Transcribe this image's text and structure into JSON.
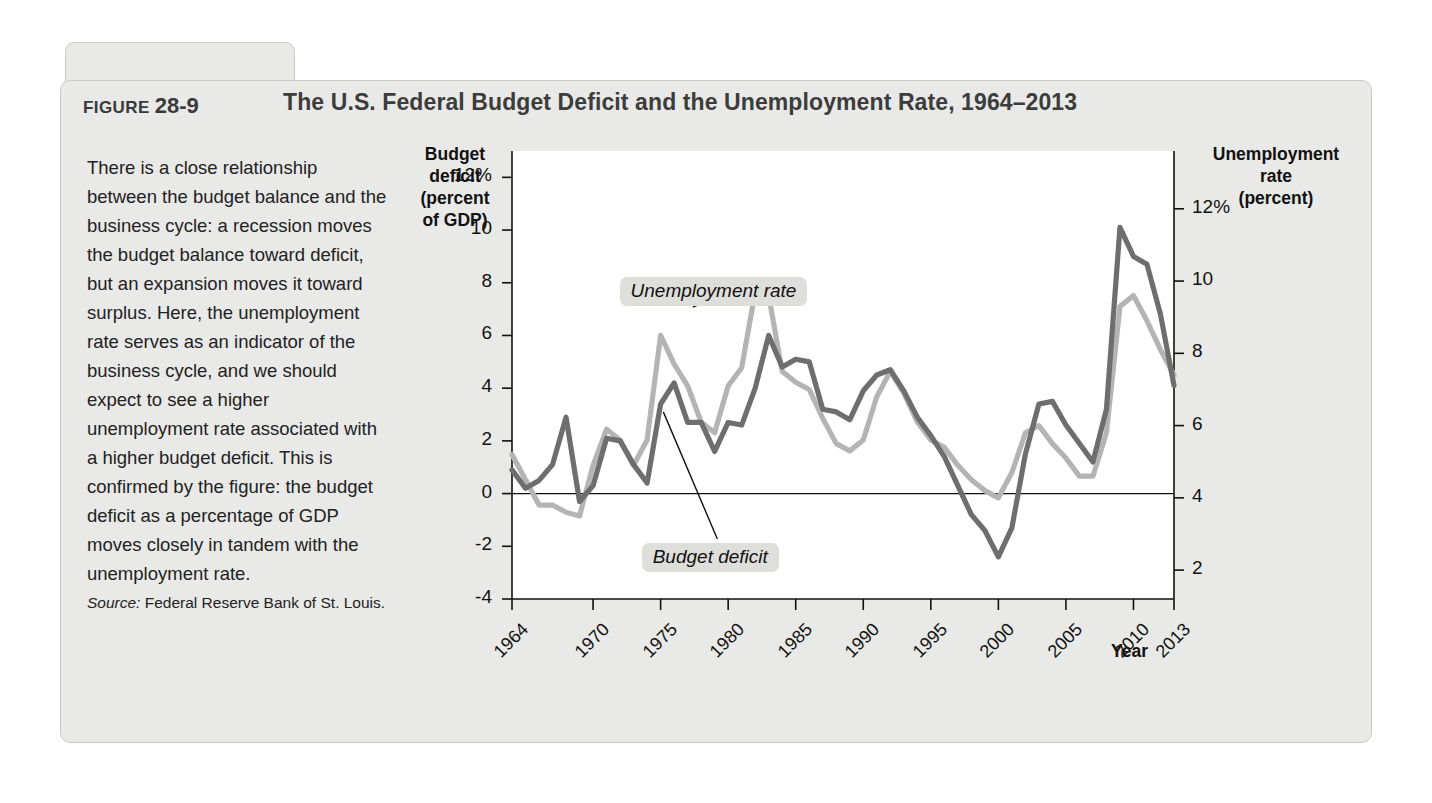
{
  "figure": {
    "label_word": "FIGURE",
    "number": "28-9",
    "title": "The U.S. Federal Budget Deficit and the Unemployment Rate, 1964–2013"
  },
  "caption": {
    "body": "There is a close relationship between the budget balance and the business cycle: a recession moves the budget balance toward deficit, but an expansion moves it toward surplus. Here, the unemployment rate serves as an indicator of the business cycle, and we should expect to see a higher unemployment rate associated with a higher budget deficit. This is confirmed by the figure: the budget deficit as a percentage of GDP moves closely in tandem with the unemployment rate.",
    "source_label": "Source:",
    "source_text": " Federal Reserve Bank of St. Louis."
  },
  "chart_data": {
    "type": "line",
    "title": "The U.S. Federal Budget Deficit and the Unemployment Rate, 1964–2013",
    "xlabel": "Year",
    "y_left_label": "Budget deficit (percent of GDP)",
    "y_left_label_lines": [
      "Budget",
      "deficit",
      "(percent",
      "of GDP)"
    ],
    "y_right_label": "Unemployment rate (percent)",
    "y_right_label_lines": [
      "Unemployment",
      "rate",
      "(percent)"
    ],
    "grid": false,
    "legend_position": "inline-annotations",
    "x": [
      1964,
      1965,
      1966,
      1967,
      1968,
      1969,
      1970,
      1971,
      1972,
      1973,
      1974,
      1975,
      1976,
      1977,
      1978,
      1979,
      1980,
      1981,
      1982,
      1983,
      1984,
      1985,
      1986,
      1987,
      1988,
      1989,
      1990,
      1991,
      1992,
      1993,
      1994,
      1995,
      1996,
      1997,
      1998,
      1999,
      2000,
      2001,
      2002,
      2003,
      2004,
      2005,
      2006,
      2007,
      2008,
      2009,
      2010,
      2011,
      2012,
      2013
    ],
    "xlim": [
      1964,
      2013
    ],
    "x_ticks": [
      "1964",
      "1970",
      "1975",
      "1980",
      "1985",
      "1990",
      "1995",
      "2000",
      "2005",
      "2010",
      "2013"
    ],
    "x_tick_values": [
      1964,
      1970,
      1975,
      1980,
      1985,
      1990,
      1995,
      2000,
      2005,
      2010,
      2013
    ],
    "y_left_ticks": [
      "12%",
      "10",
      "8",
      "6",
      "4",
      "2",
      "0",
      "-2",
      "-4"
    ],
    "y_left_tick_values": [
      12,
      10,
      8,
      6,
      4,
      2,
      0,
      -2,
      -4
    ],
    "ylim_left": [
      -4,
      13
    ],
    "y_right_ticks": [
      "12%",
      "10",
      "8",
      "6",
      "4",
      "2"
    ],
    "y_right_tick_values": [
      12,
      10,
      8,
      6,
      4,
      2
    ],
    "ylim_right": [
      1.2,
      13.6
    ],
    "series": [
      {
        "name": "Budget deficit",
        "axis": "left",
        "color": "#6e6e6e",
        "annotation": "Budget deficit",
        "values": [
          0.9,
          0.2,
          0.5,
          1.1,
          2.9,
          -0.3,
          0.3,
          2.1,
          2.0,
          1.1,
          0.4,
          3.4,
          4.2,
          2.7,
          2.7,
          1.6,
          2.7,
          2.6,
          4.0,
          6.0,
          4.8,
          5.1,
          5.0,
          3.2,
          3.1,
          2.8,
          3.9,
          4.5,
          4.7,
          3.9,
          2.9,
          2.2,
          1.4,
          0.3,
          -0.8,
          -1.4,
          -2.4,
          -1.3,
          1.5,
          3.4,
          3.5,
          2.6,
          1.9,
          1.2,
          3.2,
          10.1,
          9.0,
          8.7,
          6.8,
          4.1
        ]
      },
      {
        "name": "Unemployment rate",
        "axis": "right",
        "color": "#b4b4b4",
        "annotation": "Unemployment rate",
        "values": [
          5.2,
          4.5,
          3.8,
          3.8,
          3.6,
          3.5,
          4.9,
          5.9,
          5.6,
          4.9,
          5.6,
          8.5,
          7.7,
          7.1,
          6.1,
          5.8,
          7.1,
          7.6,
          9.7,
          9.6,
          7.5,
          7.2,
          7.0,
          6.2,
          5.5,
          5.3,
          5.6,
          6.8,
          7.5,
          6.9,
          6.1,
          5.6,
          5.4,
          4.9,
          4.5,
          4.2,
          4.0,
          4.7,
          5.8,
          6.0,
          5.5,
          5.1,
          4.6,
          4.6,
          5.8,
          9.3,
          9.6,
          8.9,
          8.1,
          7.4
        ]
      }
    ]
  }
}
